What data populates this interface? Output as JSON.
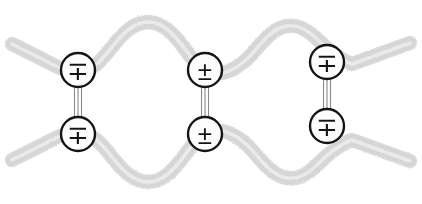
{
  "figure": {
    "background_color": "#ffffff",
    "width": 422,
    "height": 204
  },
  "style": {
    "ribbon_color": "#d2d2d2",
    "ribbon_core_color": "#e9e9e9",
    "ribbon_edge_color": "#c2c2c2",
    "ribbon_width": 13,
    "ribbon_core_width": 4,
    "circle_fill": "#fdfdfd",
    "circle_stroke": "#151515",
    "circle_stroke_width": 2.4,
    "circle_radius": 17,
    "glyph_color": "#141414",
    "bond_color": "#7d7d7d",
    "bond_width": 1.1
  },
  "strands": [
    {
      "name": "upper-strand",
      "path": "M 12,44 L 44,60 C 60,69 72,74 86,70 C 104,64 112,42 128,30 C 142,19 156,20 168,30 C 184,43 190,62 206,70 C 220,77 232,72 246,60 C 258,49 266,34 280,28 C 294,22 306,28 318,40 C 330,52 340,60 352,64 L 410,43"
    },
    {
      "name": "lower-strand",
      "path": "M 12,160 L 44,144 C 60,135 72,130 86,134 C 104,140 112,162 128,174 C 142,185 156,184 168,174 C 184,161 190,142 206,134 C 220,127 232,132 246,144 C 258,155 266,170 280,176 C 294,182 306,176 318,164 C 330,152 340,144 352,140 L 410,161"
    }
  ],
  "crosslinks": [
    {
      "name": "crosslink-left",
      "x": 78,
      "top_y": 70,
      "bottom_y": 134,
      "bond_lines": 3,
      "upper_charge": {
        "name": "charge-upper-left",
        "glyph": "∓",
        "meaning": "minus-over-plus"
      },
      "lower_charge": {
        "name": "charge-lower-left",
        "glyph": "∓",
        "meaning": "minus-over-plus"
      }
    },
    {
      "name": "crosslink-middle",
      "x": 205,
      "top_y": 70,
      "bottom_y": 134,
      "bond_lines": 3,
      "upper_charge": {
        "name": "charge-upper-middle",
        "glyph": "±",
        "meaning": "plus-over-minus"
      },
      "lower_charge": {
        "name": "charge-lower-middle",
        "glyph": "±",
        "meaning": "plus-over-minus"
      }
    },
    {
      "name": "crosslink-right",
      "x": 327,
      "top_y": 62,
      "bottom_y": 126,
      "bond_lines": 3,
      "upper_charge": {
        "name": "charge-upper-right",
        "glyph": "∓",
        "meaning": "minus-over-plus"
      },
      "lower_charge": {
        "name": "charge-lower-right",
        "glyph": "∓",
        "meaning": "minus-over-plus"
      }
    }
  ]
}
